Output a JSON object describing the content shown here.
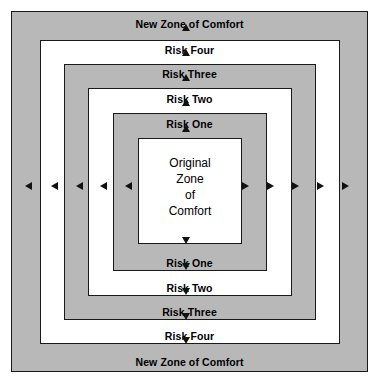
{
  "diagram": {
    "colors": {
      "ring_gray": "#b8b8b8",
      "ring_white": "#ffffff",
      "border": "#1a1a1a",
      "text": "#000000",
      "arrow": "#111111"
    },
    "rings": [
      {
        "name": "new-zone-of-comfort-outer",
        "fill": "gray",
        "x": 11,
        "y": 11,
        "w": 357,
        "h": 361
      },
      {
        "name": "risk-four-ring",
        "fill": "white",
        "x": 40,
        "y": 40,
        "w": 300,
        "h": 304
      },
      {
        "name": "risk-three-ring",
        "fill": "gray",
        "x": 64,
        "y": 64,
        "w": 252,
        "h": 256
      },
      {
        "name": "risk-two-ring",
        "fill": "white",
        "x": 88,
        "y": 88,
        "w": 204,
        "h": 208
      },
      {
        "name": "risk-one-ring",
        "fill": "gray",
        "x": 113,
        "y": 113,
        "w": 154,
        "h": 158
      },
      {
        "name": "original-zone-of-comfort",
        "fill": "white",
        "x": 138,
        "y": 138,
        "w": 104,
        "h": 106
      }
    ],
    "top_labels": [
      {
        "name": "label-new-zone-of-comfort-top",
        "text": "New Zone of Comfort",
        "y": 18
      },
      {
        "name": "label-risk-four-top",
        "text": "Risk Four",
        "y": 44
      },
      {
        "name": "label-risk-three-top",
        "text": "Risk Three",
        "y": 68
      },
      {
        "name": "label-risk-two-top",
        "text": "Risk Two",
        "y": 93
      },
      {
        "name": "label-risk-one-top",
        "text": "Risk One",
        "y": 118
      }
    ],
    "bottom_labels": [
      {
        "name": "label-risk-one-bottom",
        "text": "Risk One",
        "y": 257
      },
      {
        "name": "label-risk-two-bottom",
        "text": "Risk Two",
        "y": 282
      },
      {
        "name": "label-risk-three-bottom",
        "text": "Risk Three",
        "y": 306
      },
      {
        "name": "label-risk-four-bottom",
        "text": "Risk Four",
        "y": 330
      },
      {
        "name": "label-new-zone-of-comfort-bottom",
        "text": "New Zone of Comfort",
        "y": 356
      }
    ],
    "center": {
      "lines": [
        "Original",
        "Zone",
        "of",
        "Comfort"
      ],
      "x": 138,
      "y": 155,
      "w": 104
    },
    "arrows_up": [
      {
        "name": "arrow-up-1",
        "x": 186,
        "y": 27
      },
      {
        "name": "arrow-up-2",
        "x": 186,
        "y": 52
      },
      {
        "name": "arrow-up-3",
        "x": 186,
        "y": 77
      },
      {
        "name": "arrow-up-4",
        "x": 186,
        "y": 102
      },
      {
        "name": "arrow-up-5",
        "x": 186,
        "y": 128
      }
    ],
    "arrows_down": [
      {
        "name": "arrow-down-1",
        "x": 186,
        "y": 240
      },
      {
        "name": "arrow-down-2",
        "x": 186,
        "y": 266
      },
      {
        "name": "arrow-down-3",
        "x": 186,
        "y": 291
      },
      {
        "name": "arrow-down-4",
        "x": 186,
        "y": 316
      },
      {
        "name": "arrow-down-5",
        "x": 186,
        "y": 340
      }
    ],
    "arrows_left": [
      {
        "name": "arrow-left-1",
        "x": 28,
        "y": 186
      },
      {
        "name": "arrow-left-2",
        "x": 54,
        "y": 186
      },
      {
        "name": "arrow-left-3",
        "x": 79,
        "y": 186
      },
      {
        "name": "arrow-left-4",
        "x": 103,
        "y": 186
      },
      {
        "name": "arrow-left-5",
        "x": 128,
        "y": 186
      }
    ],
    "arrows_right": [
      {
        "name": "arrow-right-1",
        "x": 245,
        "y": 186
      },
      {
        "name": "arrow-right-2",
        "x": 270,
        "y": 186
      },
      {
        "name": "arrow-right-3",
        "x": 295,
        "y": 186
      },
      {
        "name": "arrow-right-4",
        "x": 320,
        "y": 186
      },
      {
        "name": "arrow-right-5",
        "x": 345,
        "y": 186
      }
    ]
  }
}
